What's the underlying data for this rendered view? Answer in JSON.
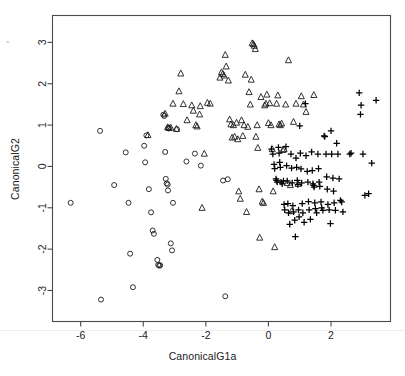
{
  "figure": {
    "background": "#ffffff",
    "frame_color": "#4a4a4a",
    "marker_color": "#1c1c1c"
  },
  "axes": {
    "x_label": "CanonicalG1a",
    "y_label": "CanonicalG2",
    "x_ticks": [
      "-6",
      "-4",
      "-2",
      "0",
      "2"
    ],
    "y_ticks": [
      "3",
      "2",
      "1",
      "0",
      "-1",
      "-2",
      "-3"
    ]
  },
  "chart_data": {
    "type": "scatter",
    "title": "",
    "xlabel": "CanonicalG1a",
    "ylabel": "CanonicalG2",
    "xlim": [
      -6.9,
      3.9
    ],
    "ylim": [
      -3.75,
      3.65
    ],
    "xticks": [
      -6,
      -4,
      -2,
      0,
      2
    ],
    "yticks": [
      -3,
      -2,
      -1,
      0,
      1,
      2,
      3
    ],
    "grid": false,
    "legend": "none",
    "series": [
      {
        "name": "group-circle",
        "marker": "circle",
        "points": [
          [
            -6.32,
            -0.88
          ],
          [
            -5.38,
            0.86
          ],
          [
            -5.35,
            -3.22
          ],
          [
            -4.93,
            -0.45
          ],
          [
            -4.56,
            0.34
          ],
          [
            -4.47,
            -0.88
          ],
          [
            -4.42,
            -2.11
          ],
          [
            -4.33,
            -2.92
          ],
          [
            -3.97,
            0.5
          ],
          [
            -3.94,
            0.1
          ],
          [
            -3.9,
            0.75
          ],
          [
            -3.82,
            -0.55
          ],
          [
            -3.75,
            -1.11
          ],
          [
            -3.7,
            -1.55
          ],
          [
            -3.66,
            -1.63
          ],
          [
            -3.55,
            -2.26
          ],
          [
            -3.52,
            -2.38
          ],
          [
            -3.49,
            -2.4
          ],
          [
            -3.46,
            -2.39
          ],
          [
            -3.36,
            1.25
          ],
          [
            -3.33,
            1.22
          ],
          [
            -3.3,
            0.35
          ],
          [
            -3.28,
            -0.3
          ],
          [
            -3.25,
            -0.41
          ],
          [
            -3.22,
            -0.44
          ],
          [
            -3.21,
            -0.58
          ],
          [
            -3.2,
            0.93
          ],
          [
            -3.18,
            0.92
          ],
          [
            -3.12,
            -1.86
          ],
          [
            -3.08,
            -2.03
          ],
          [
            -3.05,
            -0.88
          ],
          [
            -2.92,
            0.9
          ],
          [
            -2.62,
            0.12
          ],
          [
            -2.35,
            0.31
          ],
          [
            -2.16,
            0.02
          ],
          [
            -1.45,
            -0.34
          ],
          [
            -1.38,
            -3.14
          ],
          [
            -1.3,
            -0.31
          ]
        ]
      },
      {
        "name": "group-triangle",
        "marker": "triangle",
        "points": [
          [
            -3.85,
            0.76
          ],
          [
            -3.3,
            1.28
          ],
          [
            -3.22,
            0.95
          ],
          [
            -3.18,
            0.93
          ],
          [
            -3.12,
            0.94
          ],
          [
            -3.05,
            1.52
          ],
          [
            -2.94,
            0.91
          ],
          [
            -2.86,
            1.82
          ],
          [
            -2.8,
            2.25
          ],
          [
            -2.72,
            1.51
          ],
          [
            -2.6,
            1.12
          ],
          [
            -2.45,
            1.48
          ],
          [
            -2.4,
            1.35
          ],
          [
            -2.32,
            1.0
          ],
          [
            -2.28,
            0.97
          ],
          [
            -2.2,
            1.26
          ],
          [
            -2.18,
            1.46
          ],
          [
            -2.12,
            -1.0
          ],
          [
            -2.05,
            0.31
          ],
          [
            -1.95,
            1.54
          ],
          [
            -1.86,
            1.52
          ],
          [
            -1.55,
            2.15
          ],
          [
            -1.5,
            2.28
          ],
          [
            -1.46,
            2.24
          ],
          [
            -1.42,
            2.2
          ],
          [
            -1.38,
            2.7
          ],
          [
            -1.35,
            2.42
          ],
          [
            -1.28,
            2.08
          ],
          [
            -1.24,
            1.14
          ],
          [
            -1.2,
            1.02
          ],
          [
            -1.16,
            0.7
          ],
          [
            -1.12,
            1.0
          ],
          [
            -1.08,
            0.72
          ],
          [
            -1.02,
            1.06
          ],
          [
            -0.98,
            0.66
          ],
          [
            -0.95,
            -0.6
          ],
          [
            -0.9,
            -0.78
          ],
          [
            -0.86,
            1.12
          ],
          [
            -0.82,
            0.74
          ],
          [
            -0.78,
            1.0
          ],
          [
            -0.74,
            2.22
          ],
          [
            -0.7,
            -1.1
          ],
          [
            -0.66,
            0.96
          ],
          [
            -0.62,
            1.8
          ],
          [
            -0.58,
            1.5
          ],
          [
            -0.55,
            2.1
          ],
          [
            -0.52,
            2.98
          ],
          [
            -0.48,
            2.96
          ],
          [
            -0.45,
            2.92
          ],
          [
            -0.42,
            2.84
          ],
          [
            -0.4,
            0.72
          ],
          [
            -0.36,
            1.0
          ],
          [
            -0.34,
            0.45
          ],
          [
            -0.3,
            -0.55
          ],
          [
            -0.28,
            -1.72
          ],
          [
            -0.24,
            1.68
          ],
          [
            -0.2,
            -0.85
          ],
          [
            -0.16,
            -0.88
          ],
          [
            -0.12,
            1.48
          ],
          [
            -0.08,
            1.52
          ],
          [
            -0.05,
            1.74
          ],
          [
            0.0,
            1.05
          ],
          [
            0.04,
            1.53
          ],
          [
            0.08,
            1.0
          ],
          [
            0.12,
            0.42
          ],
          [
            0.15,
            -0.6
          ],
          [
            0.2,
            -1.95
          ],
          [
            0.26,
            1.52
          ],
          [
            0.3,
            1.72
          ],
          [
            0.34,
            1.02
          ],
          [
            0.38,
            1.0
          ],
          [
            0.42,
            1.04
          ],
          [
            0.46,
            0.4
          ],
          [
            0.5,
            0.42
          ],
          [
            0.55,
            1.5
          ],
          [
            0.6,
            -0.4
          ],
          [
            0.64,
            2.57
          ],
          [
            0.7,
            -0.45
          ],
          [
            0.74,
            -1.08
          ],
          [
            0.8,
            1.08
          ],
          [
            0.88,
            1.52
          ],
          [
            0.95,
            -0.42
          ],
          [
            1.05,
            1.7
          ],
          [
            1.12,
            1.5
          ],
          [
            1.2,
            1.32
          ],
          [
            1.45,
            1.73
          ]
        ]
      },
      {
        "name": "group-plus",
        "marker": "plus",
        "points": [
          [
            0.1,
            0.42
          ],
          [
            0.14,
            0.3
          ],
          [
            0.18,
            0.05
          ],
          [
            0.2,
            -0.05
          ],
          [
            0.24,
            -0.3
          ],
          [
            0.26,
            -0.34
          ],
          [
            0.28,
            -0.38
          ],
          [
            0.32,
            0.46
          ],
          [
            0.34,
            0.32
          ],
          [
            0.36,
            0.1
          ],
          [
            0.38,
            -0.02
          ],
          [
            0.4,
            -0.38
          ],
          [
            0.44,
            -0.42
          ],
          [
            0.48,
            -0.35
          ],
          [
            0.5,
            -0.92
          ],
          [
            0.52,
            -1.05
          ],
          [
            0.56,
            0.48
          ],
          [
            0.58,
            0.02
          ],
          [
            0.6,
            -0.35
          ],
          [
            0.62,
            -0.9
          ],
          [
            0.64,
            -1.12
          ],
          [
            0.68,
            -1.4
          ],
          [
            0.72,
            0.3
          ],
          [
            0.74,
            -0.04
          ],
          [
            0.76,
            -0.4
          ],
          [
            0.78,
            -0.95
          ],
          [
            0.8,
            -1.1
          ],
          [
            0.84,
            -1.3
          ],
          [
            0.86,
            -1.7
          ],
          [
            0.88,
            0.2
          ],
          [
            0.9,
            -0.02
          ],
          [
            0.92,
            -0.34
          ],
          [
            0.94,
            -0.44
          ],
          [
            0.96,
            -1.05
          ],
          [
            0.98,
            -1.22
          ],
          [
            1.0,
            0.98
          ],
          [
            1.02,
            0.32
          ],
          [
            1.04,
            -0.06
          ],
          [
            1.06,
            -0.4
          ],
          [
            1.08,
            -0.9
          ],
          [
            1.1,
            -1.12
          ],
          [
            1.14,
            -1.35
          ],
          [
            1.18,
            1.52
          ],
          [
            1.2,
            0.26
          ],
          [
            1.24,
            -0.12
          ],
          [
            1.26,
            -0.38
          ],
          [
            1.28,
            -0.85
          ],
          [
            1.3,
            -1.05
          ],
          [
            1.34,
            -1.28
          ],
          [
            1.38,
            0.35
          ],
          [
            1.4,
            -0.1
          ],
          [
            1.42,
            -0.42
          ],
          [
            1.44,
            -0.46
          ],
          [
            1.46,
            -0.5
          ],
          [
            1.48,
            -0.88
          ],
          [
            1.5,
            -1.02
          ],
          [
            1.54,
            -1.12
          ],
          [
            1.58,
            0.3
          ],
          [
            1.6,
            -0.05
          ],
          [
            1.62,
            -0.38
          ],
          [
            1.64,
            -0.48
          ],
          [
            1.68,
            -0.86
          ],
          [
            1.7,
            -1.0
          ],
          [
            1.74,
            -1.06
          ],
          [
            1.78,
            0.74
          ],
          [
            1.8,
            0.72
          ],
          [
            1.84,
            0.3
          ],
          [
            1.86,
            -0.25
          ],
          [
            1.88,
            -0.55
          ],
          [
            1.9,
            -0.92
          ],
          [
            1.94,
            -1.05
          ],
          [
            1.98,
            -1.38
          ],
          [
            2.0,
            0.86
          ],
          [
            2.02,
            0.3
          ],
          [
            2.06,
            -0.28
          ],
          [
            2.08,
            -0.6
          ],
          [
            2.1,
            -0.88
          ],
          [
            2.14,
            -1.06
          ],
          [
            2.18,
            0.56
          ],
          [
            2.22,
            0.3
          ],
          [
            2.26,
            -0.3
          ],
          [
            2.3,
            -0.82
          ],
          [
            2.34,
            -0.86
          ],
          [
            2.38,
            -1.1
          ],
          [
            2.6,
            0.3
          ],
          [
            2.64,
            0.32
          ],
          [
            2.9,
            1.78
          ],
          [
            2.94,
            1.26
          ],
          [
            2.96,
            1.48
          ],
          [
            3.02,
            0.3
          ],
          [
            3.08,
            -0.7
          ],
          [
            3.2,
            -0.66
          ],
          [
            3.3,
            0.08
          ],
          [
            3.44,
            1.6
          ]
        ]
      }
    ]
  }
}
